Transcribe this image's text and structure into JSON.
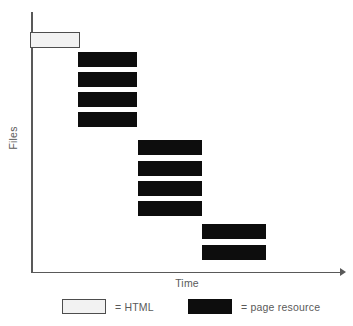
{
  "chart_data": {
    "type": "bar",
    "title": "",
    "subtitle": "",
    "xlabel": "Time",
    "ylabel": "Files",
    "orientation": "horizontal",
    "grid": false,
    "axis_style": "open-left-bottom-with-arrow",
    "xlim": [
      0,
      312
    ],
    "ylim": [
      0,
      261
    ],
    "legend_position": "below-plot",
    "annotations": [],
    "xtick_labels": [],
    "ytick_labels": [],
    "legend": [
      {
        "key": "html",
        "label": "= HTML",
        "color": "#f2f2f2",
        "border_color": "#4d4d4d"
      },
      {
        "key": "resource",
        "label": "= page resource",
        "color": "#0d0d0d",
        "border_color": "#0d0d0d"
      }
    ],
    "series": [
      {
        "name": "HTML",
        "key": "html",
        "color": "#f2f2f2",
        "values": [
          {
            "label": "html-document",
            "start": 0,
            "end": 50,
            "row": 0
          }
        ]
      },
      {
        "name": "page resource",
        "key": "resource",
        "color": "#0d0d0d",
        "values": [
          {
            "label": "resource-1",
            "start": 47,
            "end": 106,
            "row": 1
          },
          {
            "label": "resource-2",
            "start": 47,
            "end": 106,
            "row": 2
          },
          {
            "label": "resource-3",
            "start": 47,
            "end": 106,
            "row": 3
          },
          {
            "label": "resource-4",
            "start": 47,
            "end": 106,
            "row": 4
          },
          {
            "label": "resource-5",
            "start": 107,
            "end": 171,
            "row": 5
          },
          {
            "label": "resource-6",
            "start": 107,
            "end": 171,
            "row": 6
          },
          {
            "label": "resource-7",
            "start": 107,
            "end": 171,
            "row": 7
          },
          {
            "label": "resource-8",
            "start": 107,
            "end": 171,
            "row": 8
          },
          {
            "label": "resource-9",
            "start": 171,
            "end": 235,
            "row": 9
          },
          {
            "label": "resource-10",
            "start": 171,
            "end": 235,
            "row": 10
          }
        ]
      }
    ],
    "bars": [
      {
        "name": "bar-html-document",
        "kind": "html",
        "x": 30,
        "y": 32,
        "w": 50,
        "h": 16
      },
      {
        "name": "bar-resource-1",
        "kind": "resource",
        "x": 78,
        "y": 52,
        "w": 59,
        "h": 15
      },
      {
        "name": "bar-resource-2",
        "kind": "resource",
        "x": 78,
        "y": 72,
        "w": 59,
        "h": 15
      },
      {
        "name": "bar-resource-3",
        "kind": "resource",
        "x": 78,
        "y": 92,
        "w": 59,
        "h": 15
      },
      {
        "name": "bar-resource-4",
        "kind": "resource",
        "x": 78,
        "y": 112,
        "w": 59,
        "h": 15
      },
      {
        "name": "bar-resource-5",
        "kind": "resource",
        "x": 138,
        "y": 140,
        "w": 64,
        "h": 15
      },
      {
        "name": "bar-resource-6",
        "kind": "resource",
        "x": 138,
        "y": 161,
        "w": 64,
        "h": 15
      },
      {
        "name": "bar-resource-7",
        "kind": "resource",
        "x": 138,
        "y": 181,
        "w": 64,
        "h": 15
      },
      {
        "name": "bar-resource-8",
        "kind": "resource",
        "x": 138,
        "y": 201,
        "w": 64,
        "h": 15
      },
      {
        "name": "bar-resource-9",
        "kind": "resource",
        "x": 202,
        "y": 224,
        "w": 64,
        "h": 15
      },
      {
        "name": "bar-resource-10",
        "kind": "resource",
        "x": 202,
        "y": 245,
        "w": 64,
        "h": 15
      }
    ]
  },
  "axes": {
    "y_title": "Files",
    "x_title": "Time"
  },
  "legend": {
    "html": {
      "label": "= HTML"
    },
    "resource": {
      "label": "= page resource"
    }
  },
  "colors": {
    "axis": "#595959",
    "text": "#5a5a5a",
    "html_fill": "#f2f2f2",
    "html_border": "#4d4d4d",
    "resource_fill": "#0d0d0d",
    "background": "#ffffff"
  }
}
